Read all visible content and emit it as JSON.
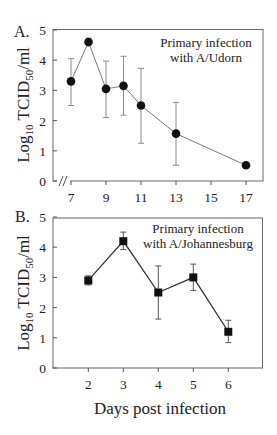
{
  "figure": {
    "panels": [
      {
        "letter": "A.",
        "annotation_lines": [
          "Primary infection",
          "with A/Udorn"
        ],
        "ylabel_main": "Log",
        "ylabel_sub": "10",
        "ylabel_mid": " TCID",
        "ylabel_sub2": "50",
        "ylabel_end": "/ml",
        "xlabel": "",
        "axis_break": "//"
      },
      {
        "letter": "B.",
        "annotation_lines": [
          "Primary infection",
          "with A/Johannesburg"
        ],
        "ylabel_main": "Log",
        "ylabel_sub": "10",
        "ylabel_mid": " TCID",
        "ylabel_sub2": "50",
        "ylabel_end": "/ml",
        "xlabel": "Days post infection"
      }
    ],
    "colors": {
      "line_a": "#7a7a7a",
      "errorbar_a": "#8a8a8a",
      "line_b": "#333333",
      "errorbar_b": "#555555",
      "marker": "#111111",
      "axis": "#555555"
    }
  },
  "chart_data": [
    {
      "type": "line",
      "title": "A. Primary infection with A/Udorn",
      "xlabel": "",
      "ylabel": "Log10 TCID50/ml",
      "x": [
        7,
        8,
        9,
        10,
        11,
        13,
        17
      ],
      "series": [
        {
          "name": "Primary infection with A/Udorn",
          "marker": "circle",
          "values": [
            3.3,
            4.6,
            3.05,
            3.15,
            2.5,
            1.57,
            0.52
          ],
          "error_upper": [
            4.05,
            4.73,
            3.97,
            4.13,
            3.73,
            2.6,
            0.52
          ],
          "error_lower": [
            2.5,
            4.5,
            2.1,
            2.18,
            1.25,
            0.52,
            0.52
          ]
        }
      ],
      "xticks": [
        7,
        9,
        11,
        13,
        15,
        17
      ],
      "yticks": [
        0,
        1,
        2,
        3,
        4,
        5
      ],
      "xlim": [
        5.6,
        18
      ],
      "ylim": [
        0,
        5
      ],
      "axis_break": true,
      "grid": false,
      "legend": "annotation top-right"
    },
    {
      "type": "line",
      "title": "B. Primary infection with A/Johannesburg",
      "xlabel": "Days post infection",
      "ylabel": "Log10 TCID50/ml",
      "x": [
        2,
        3,
        4,
        5,
        6
      ],
      "series": [
        {
          "name": "Primary infection with A/Johannesburg",
          "marker": "square",
          "values": [
            2.9,
            4.2,
            2.5,
            3.0,
            1.2
          ],
          "error_upper": [
            3.05,
            4.5,
            3.38,
            3.44,
            1.58
          ],
          "error_lower": [
            2.75,
            3.92,
            1.62,
            2.57,
            0.84
          ]
        }
      ],
      "xticks": [
        2,
        3,
        4,
        5,
        6
      ],
      "yticks": [
        0,
        1,
        2,
        3,
        4,
        5
      ],
      "xlim": [
        0.95,
        7.0
      ],
      "ylim": [
        0,
        5
      ],
      "grid": false,
      "legend": "annotation top-right"
    }
  ]
}
